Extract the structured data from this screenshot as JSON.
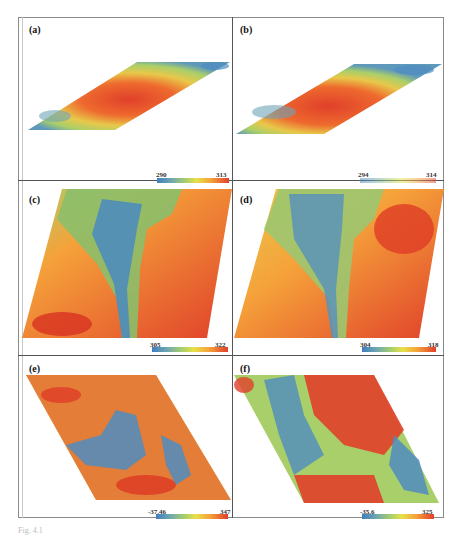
{
  "figure": {
    "caption": "Fig. 4.1",
    "panels": [
      {
        "label": "(a)",
        "colorbar": {
          "min": "290",
          "max": "313"
        }
      },
      {
        "label": "(b)",
        "colorbar": {
          "min": "294",
          "max": "314"
        }
      },
      {
        "label": "(c)",
        "colorbar": {
          "min": "305",
          "max": "322"
        }
      },
      {
        "label": "(d)",
        "colorbar": {
          "min": "304",
          "max": "318"
        }
      },
      {
        "label": "(e)",
        "colorbar": {
          "min": "-37.46",
          "max": "347"
        }
      },
      {
        "label": "(f)",
        "colorbar": {
          "min": "-35.6",
          "max": "325"
        }
      }
    ],
    "colormap": [
      "#3f7fbf",
      "#6fa8b0",
      "#a9cf6a",
      "#e8e04a",
      "#f5a23a",
      "#e0402a"
    ]
  }
}
